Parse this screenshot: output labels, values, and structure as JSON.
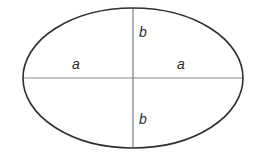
{
  "figure": {
    "type": "geometry-diagram",
    "shape": "ellipse",
    "background_color": "#ffffff",
    "outline_color": "#2f2f2f",
    "axis_color": "#8a8a8a",
    "label_color": "#2b2b2b"
  },
  "geometry": {
    "center_x": 133,
    "center_y": 78,
    "semi_axis_horizontal": 110,
    "semi_axis_vertical": 70,
    "outline_width": 1.6,
    "axis_width": 1.1
  },
  "labels": {
    "a_left": "a",
    "a_right": "a",
    "b_top": "b",
    "b_bottom": "b"
  },
  "icons": {
    "ellipse": "ellipse-outline",
    "horizontal_axis": "horizontal-axis-line",
    "vertical_axis": "vertical-axis-line"
  }
}
